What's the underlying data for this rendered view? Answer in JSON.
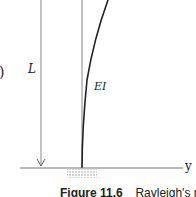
{
  "diagram": {
    "length_label": "L",
    "stiffness_label": "EI",
    "axis_label": "y",
    "partial_glyph": ")"
  },
  "caption": {
    "figure_number": "Figure 11.6",
    "text": "Rayleigh's method of"
  }
}
